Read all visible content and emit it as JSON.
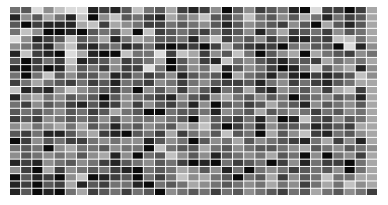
{
  "chart_data": {
    "type": "heatmap",
    "title": "",
    "xlabel": "",
    "ylabel": "",
    "colormap": "grayscale (0 = white, 9 = black)",
    "value_range": [
      0,
      9
    ],
    "n_rows": 26,
    "n_cols": 33,
    "values": [
      [
        5,
        6,
        1,
        4,
        2,
        1,
        1,
        8,
        7,
        8,
        6,
        2,
        5,
        6,
        3,
        7,
        8,
        7,
        4,
        9,
        6,
        4,
        7,
        6,
        5,
        8,
        9,
        1,
        7,
        7,
        9,
        7,
        3
      ],
      [
        8,
        4,
        6,
        3,
        5,
        8,
        2,
        9,
        4,
        2,
        6,
        5,
        7,
        8,
        3,
        5,
        4,
        2,
        6,
        7,
        5,
        2,
        5,
        6,
        4,
        6,
        3,
        5,
        8,
        5,
        7,
        6,
        3
      ],
      [
        6,
        9,
        7,
        8,
        8,
        8,
        3,
        2,
        7,
        3,
        4,
        5,
        7,
        7,
        5,
        6,
        5,
        4,
        6,
        8,
        6,
        4,
        5,
        6,
        7,
        4,
        6,
        9,
        3,
        6,
        8,
        6,
        3
      ],
      [
        5,
        2,
        4,
        9,
        9,
        8,
        9,
        6,
        5,
        6,
        3,
        9,
        2,
        7,
        6,
        5,
        6,
        7,
        5,
        7,
        6,
        4,
        8,
        5,
        3,
        7,
        6,
        5,
        7,
        4,
        6,
        5,
        3
      ],
      [
        1,
        4,
        8,
        7,
        6,
        2,
        6,
        5,
        3,
        8,
        5,
        3,
        4,
        6,
        6,
        5,
        8,
        4,
        2,
        7,
        5,
        6,
        4,
        7,
        5,
        8,
        8,
        6,
        7,
        2,
        2,
        5,
        3
      ],
      [
        4,
        5,
        7,
        8,
        4,
        2,
        7,
        8,
        6,
        5,
        8,
        7,
        5,
        8,
        9,
        8,
        7,
        9,
        7,
        3,
        6,
        7,
        8,
        7,
        9,
        5,
        4,
        6,
        6,
        9,
        1,
        8,
        4
      ],
      [
        8,
        2,
        7,
        8,
        9,
        1,
        3,
        8,
        9,
        9,
        2,
        5,
        5,
        1,
        7,
        2,
        3,
        7,
        4,
        6,
        2,
        5,
        9,
        6,
        4,
        3,
        9,
        3,
        5,
        6,
        7,
        4,
        5
      ],
      [
        6,
        9,
        7,
        5,
        7,
        2,
        8,
        7,
        6,
        4,
        7,
        6,
        5,
        3,
        9,
        6,
        4,
        7,
        8,
        2,
        5,
        4,
        6,
        7,
        8,
        6,
        6,
        7,
        3,
        5,
        4,
        5,
        3
      ],
      [
        8,
        9,
        7,
        9,
        8,
        3,
        6,
        5,
        7,
        4,
        7,
        7,
        1,
        5,
        9,
        6,
        4,
        5,
        2,
        8,
        6,
        4,
        5,
        7,
        9,
        8,
        5,
        2,
        6,
        4,
        3,
        8,
        4
      ],
      [
        5,
        9,
        5,
        2,
        6,
        4,
        6,
        6,
        4,
        8,
        7,
        5,
        7,
        6,
        4,
        8,
        6,
        5,
        6,
        9,
        3,
        5,
        6,
        8,
        5,
        8,
        9,
        7,
        8,
        7,
        6,
        2,
        4
      ],
      [
        7,
        5,
        3,
        5,
        6,
        7,
        5,
        7,
        6,
        8,
        5,
        6,
        7,
        4,
        5,
        7,
        5,
        4,
        6,
        7,
        7,
        6,
        8,
        5,
        4,
        7,
        5,
        7,
        8,
        6,
        5,
        3,
        3
      ],
      [
        2,
        8,
        7,
        8,
        4,
        2,
        4,
        5,
        6,
        7,
        5,
        9,
        4,
        6,
        4,
        7,
        4,
        6,
        8,
        5,
        6,
        3,
        7,
        8,
        4,
        5,
        6,
        4,
        7,
        3,
        2,
        7,
        3
      ],
      [
        8,
        4,
        3,
        5,
        4,
        6,
        5,
        6,
        9,
        6,
        4,
        5,
        6,
        7,
        8,
        4,
        6,
        7,
        4,
        3,
        5,
        6,
        4,
        6,
        5,
        9,
        6,
        5,
        4,
        6,
        5,
        8,
        3
      ],
      [
        5,
        7,
        4,
        6,
        5,
        7,
        8,
        6,
        8,
        7,
        4,
        7,
        4,
        6,
        7,
        5,
        8,
        4,
        9,
        6,
        5,
        7,
        6,
        3,
        5,
        6,
        8,
        4,
        6,
        5,
        4,
        6,
        3
      ],
      [
        6,
        5,
        6,
        5,
        4,
        6,
        5,
        7,
        6,
        3,
        5,
        6,
        9,
        9,
        5,
        6,
        6,
        5,
        8,
        4,
        5,
        6,
        3,
        6,
        5,
        4,
        5,
        7,
        5,
        6,
        4,
        5,
        3
      ],
      [
        7,
        6,
        7,
        4,
        5,
        6,
        5,
        6,
        4,
        6,
        4,
        5,
        5,
        4,
        5,
        6,
        9,
        3,
        6,
        6,
        7,
        5,
        8,
        4,
        9,
        8,
        2,
        6,
        7,
        4,
        6,
        5,
        3
      ],
      [
        4,
        3,
        5,
        4,
        3,
        5,
        3,
        6,
        5,
        8,
        5,
        6,
        4,
        5,
        6,
        3,
        4,
        2,
        6,
        9,
        7,
        5,
        8,
        4,
        6,
        6,
        5,
        8,
        7,
        6,
        7,
        3,
        3
      ],
      [
        6,
        7,
        5,
        8,
        8,
        6,
        4,
        3,
        7,
        8,
        9,
        6,
        5,
        7,
        3,
        7,
        5,
        4,
        6,
        2,
        6,
        5,
        9,
        3,
        6,
        4,
        2,
        7,
        8,
        5,
        6,
        4,
        3
      ],
      [
        9,
        7,
        4,
        6,
        5,
        7,
        7,
        5,
        4,
        5,
        4,
        4,
        8,
        6,
        4,
        5,
        9,
        6,
        4,
        5,
        3,
        6,
        4,
        5,
        6,
        7,
        8,
        5,
        3,
        7,
        4,
        8,
        3
      ],
      [
        5,
        6,
        5,
        9,
        4,
        3,
        5,
        5,
        6,
        4,
        5,
        5,
        9,
        2,
        5,
        6,
        6,
        3,
        5,
        6,
        4,
        5,
        6,
        6,
        5,
        4,
        3,
        6,
        5,
        4,
        6,
        5,
        4
      ],
      [
        4,
        6,
        5,
        4,
        5,
        4,
        6,
        4,
        3,
        8,
        4,
        9,
        5,
        6,
        2,
        4,
        6,
        4,
        8,
        6,
        5,
        4,
        5,
        3,
        6,
        5,
        9,
        4,
        9,
        5,
        4,
        7,
        3
      ],
      [
        8,
        7,
        8,
        4,
        5,
        6,
        4,
        5,
        7,
        8,
        6,
        5,
        4,
        6,
        5,
        7,
        9,
        8,
        9,
        5,
        7,
        6,
        5,
        9,
        7,
        4,
        8,
        5,
        7,
        7,
        9,
        5,
        3
      ],
      [
        4,
        7,
        9,
        3,
        7,
        4,
        5,
        6,
        5,
        7,
        8,
        9,
        5,
        6,
        5,
        3,
        4,
        6,
        4,
        8,
        5,
        9,
        5,
        4,
        5,
        7,
        6,
        5,
        6,
        4,
        9,
        5,
        3
      ],
      [
        9,
        6,
        8,
        7,
        9,
        4,
        2,
        9,
        8,
        7,
        6,
        9,
        5,
        7,
        5,
        2,
        4,
        3,
        5,
        6,
        9,
        5,
        6,
        3,
        7,
        4,
        6,
        5,
        2,
        5,
        5,
        3,
        3
      ],
      [
        8,
        7,
        9,
        6,
        7,
        3,
        8,
        6,
        7,
        5,
        5,
        8,
        9,
        5,
        6,
        5,
        3,
        4,
        5,
        6,
        5,
        4,
        5,
        3,
        5,
        4,
        7,
        5,
        3,
        5,
        2,
        4,
        3
      ],
      [
        8,
        6,
        9,
        8,
        9,
        5,
        3,
        7,
        6,
        5,
        7,
        5,
        6,
        9,
        4,
        5,
        6,
        5,
        7,
        5,
        6,
        4,
        5,
        6,
        7,
        5,
        6,
        3,
        5,
        6,
        4,
        5,
        7
      ]
    ]
  }
}
